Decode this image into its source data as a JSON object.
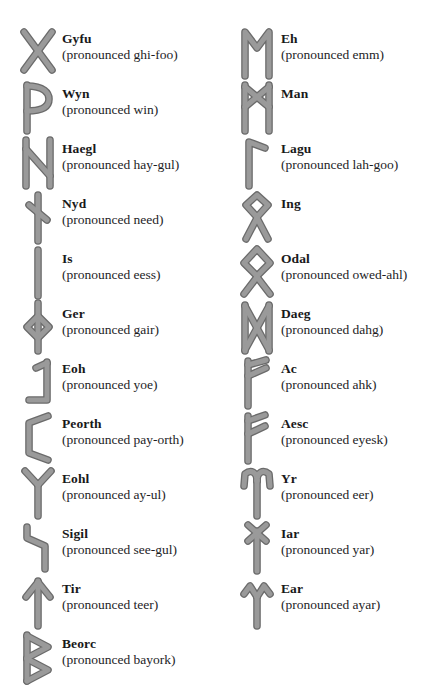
{
  "page": {
    "background_color": "#ffffff",
    "glyph_fill_color": "#9a9a9a",
    "glyph_stroke_color": "#6b6b6b",
    "text_color": "#19191a"
  },
  "columns": [
    {
      "id": "left-column",
      "runes": [
        {
          "name": "Gyfu",
          "pronunciation": "(pronounced ghi-foo)",
          "glyph": "rune-gyfu-icon"
        },
        {
          "name": "Wyn",
          "pronunciation": "(pronounced win)",
          "glyph": "rune-wyn-icon"
        },
        {
          "name": "Haegl",
          "pronunciation": "(pronounced hay-gul)",
          "glyph": "rune-haegl-icon"
        },
        {
          "name": "Nyd",
          "pronunciation": "(pronounced need)",
          "glyph": "rune-nyd-icon"
        },
        {
          "name": "Is",
          "pronunciation": "(pronounced eess)",
          "glyph": "rune-is-icon"
        },
        {
          "name": "Ger",
          "pronunciation": "(pronounced gair)",
          "glyph": "rune-ger-icon"
        },
        {
          "name": "Eoh",
          "pronunciation": "(pronounced yoe)",
          "glyph": "rune-eoh-icon"
        },
        {
          "name": "Peorth",
          "pronunciation": "(pronounced pay-orth)",
          "glyph": "rune-peorth-icon"
        },
        {
          "name": "Eohl",
          "pronunciation": "(pronounced ay-ul)",
          "glyph": "rune-eohl-icon"
        },
        {
          "name": "Sigil",
          "pronunciation": "(pronounced see-gul)",
          "glyph": "rune-sigil-icon"
        },
        {
          "name": "Tir",
          "pronunciation": "(pronounced teer)",
          "glyph": "rune-tir-icon"
        },
        {
          "name": "Beorc",
          "pronunciation": "(pronounced bayork)",
          "glyph": "rune-beorc-icon"
        }
      ]
    },
    {
      "id": "right-column",
      "runes": [
        {
          "name": "Eh",
          "pronunciation": "(pronounced emm)",
          "glyph": "rune-eh-icon"
        },
        {
          "name": "Man",
          "pronunciation": "",
          "glyph": "rune-man-icon"
        },
        {
          "name": "Lagu",
          "pronunciation": "(pronounced lah-goo)",
          "glyph": "rune-lagu-icon"
        },
        {
          "name": "Ing",
          "pronunciation": "",
          "glyph": "rune-ing-icon"
        },
        {
          "name": "Odal",
          "pronunciation": "(pronounced owed-ahl)",
          "glyph": "rune-odal-icon"
        },
        {
          "name": "Daeg",
          "pronunciation": "(pronounced dahg)",
          "glyph": "rune-daeg-icon"
        },
        {
          "name": "Ac",
          "pronunciation": "(pronounced ahk)",
          "glyph": "rune-ac-icon"
        },
        {
          "name": "Aesc",
          "pronunciation": "(pronounced eyesk)",
          "glyph": "rune-aesc-icon"
        },
        {
          "name": "Yr",
          "pronunciation": "(pronounced eer)",
          "glyph": "rune-yr-icon"
        },
        {
          "name": "Iar",
          "pronunciation": "(pronounced yar)",
          "glyph": "rune-iar-icon"
        },
        {
          "name": "Ear",
          "pronunciation": "(pronounced ayar)",
          "glyph": "rune-ear-icon"
        }
      ]
    }
  ],
  "glyph_paths": {
    "rune-gyfu-icon": [
      "M6 6 L34 44",
      "M34 6 L6 44"
    ],
    "rune-wyn-icon": [
      "M9 4 L9 50",
      "M9 5 C26 5 31 12 31 18 C31 25 25 30 9 30"
    ],
    "rune-haegl-icon": [
      "M8 4 L8 50",
      "M32 4 L32 50",
      "M8 13 L32 40"
    ],
    "rune-nyd-icon": [
      "M20 4 L20 50",
      "M11 14 L29 29"
    ],
    "rune-is-icon": [
      "M20 4 L20 50"
    ],
    "rune-ger-icon": [
      "M20 2 L20 50",
      "M20 15 L31 26 L20 37 L9 26 Z"
    ],
    "rune-eoh-icon": [
      "M29 6 L29 44 L11 44",
      "M29 7 L18 12"
    ],
    "rune-peorth-icon": [
      "M30 5 L11 12 L11 42 L30 49"
    ],
    "rune-eohl-icon": [
      "M20 18 L20 50",
      "M20 19 L7 5",
      "M20 19 L33 5"
    ],
    "rune-sigil-icon": [
      "M9 6 L9 17 L27 25 L27 48"
    ],
    "rune-tir-icon": [
      "M20 5 L20 50",
      "M20 6 L8 21",
      "M20 6 L32 21"
    ],
    "rune-beorc-icon": [
      "M9 4 L9 50",
      "M9 5 L30 16 L9 27",
      "M9 28 L30 39 L9 50"
    ],
    "rune-eh-icon": [
      "M8 50 L8 6 L20 22 L32 6 L32 50"
    ],
    "rune-man-icon": [
      "M8 4 L8 50",
      "M32 4 L32 50",
      "M8 6 L32 26",
      "M32 6 L8 26"
    ],
    "rune-lagu-icon": [
      "M12 50 L12 6 L28 12"
    ],
    "rune-ing-icon": [
      "M20 26 L9 14 L20 4 L31 14 Z",
      "M9 48 L20 27",
      "M31 48 L20 27"
    ],
    "rune-odal-icon": [
      "M20 30 L7 17 L20 3 L33 17 Z",
      "M7 48 L20 31",
      "M33 48 L20 31"
    ],
    "rune-daeg-icon": [
      "M8 4 L8 50",
      "M32 4 L32 50",
      "M8 5 L32 49",
      "M32 5 L8 49"
    ],
    "rune-ac-icon": [
      "M11 5 L11 50",
      "M11 9 L29 4",
      "M11 20 L29 12"
    ],
    "rune-aesc-icon": [
      "M11 5 L11 50",
      "M11 10 L28 4",
      "M11 23 L28 15"
    ],
    "rune-yr-icon": [
      "M20 14 L20 50",
      "M20 15 C20 6 14 3 8 8 L7 20",
      "M20 15 C20 6 26 3 32 8 L33 20"
    ],
    "rune-iar-icon": [
      "M20 10 L20 50",
      "M11 4 L29 20",
      "M29 4 L11 20"
    ],
    "rune-ear-icon": [
      "M20 20 L20 50",
      "M20 21 L13 10 L7 18",
      "M20 21 L27 10 L33 18"
    ]
  }
}
